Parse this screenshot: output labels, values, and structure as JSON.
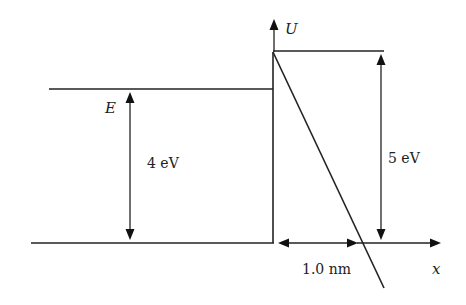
{
  "diagram": {
    "labels": {
      "potential_axis": "U",
      "position_axis": "x",
      "energy_level": "E",
      "electron_energy": "4 eV",
      "barrier_height": "5 eV",
      "barrier_width": "1.0 nm"
    },
    "colors": {
      "line": "#222222",
      "background": "#ffffff"
    }
  }
}
